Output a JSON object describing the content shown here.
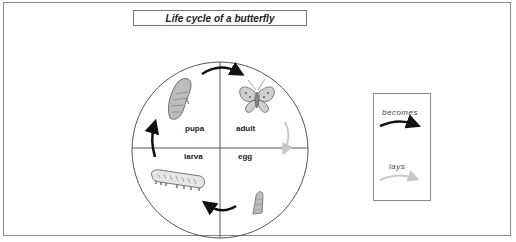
{
  "title": "Life cycle of a butterfly",
  "stages": [
    {
      "id": "pupa",
      "label": "pupa",
      "quadrant": "top-left"
    },
    {
      "id": "adult",
      "label": "adult",
      "quadrant": "top-right"
    },
    {
      "id": "egg",
      "label": "egg",
      "quadrant": "bottom-right"
    },
    {
      "id": "larva",
      "label": "larva",
      "quadrant": "bottom-left"
    }
  ],
  "transitions": [
    {
      "from": "pupa",
      "to": "adult",
      "relation": "becomes"
    },
    {
      "from": "adult",
      "to": "egg",
      "relation": "lays"
    },
    {
      "from": "egg",
      "to": "larva",
      "relation": "becomes"
    },
    {
      "from": "larva",
      "to": "pupa",
      "relation": "becomes"
    }
  ],
  "legend": {
    "items": [
      {
        "label": "becomes",
        "color": "#111111"
      },
      {
        "label": "lays",
        "color": "#c8c8c8"
      }
    ]
  },
  "colors": {
    "becomes_arrow": "#111111",
    "lays_arrow": "#c8c8c8",
    "outline": "#555555"
  }
}
